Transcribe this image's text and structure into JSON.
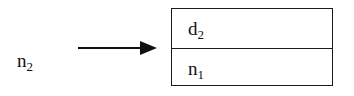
{
  "diagram": {
    "pointer_node": {
      "label": "n",
      "subscript": "2"
    },
    "arrow": {
      "direction": "right",
      "color": "#111111"
    },
    "box": {
      "cells": [
        {
          "label": "d",
          "subscript": "2"
        },
        {
          "label": "n",
          "subscript": "1"
        }
      ],
      "border_color": "#1a1a1a"
    }
  }
}
